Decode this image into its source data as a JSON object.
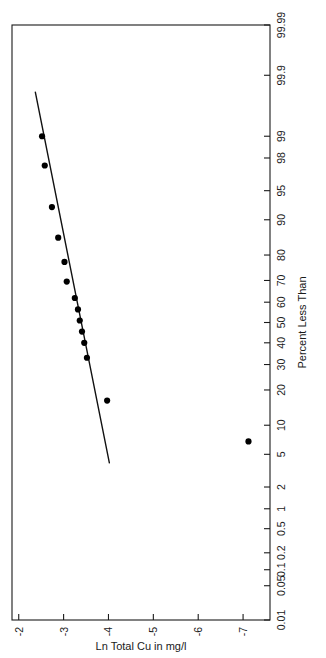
{
  "figure": {
    "kind": "lognormal-probability-plot",
    "rotation_degrees": -90,
    "background_color": "#ffffff",
    "ink_color": "#000000"
  },
  "chart_data": {
    "type": "scatter",
    "title": "",
    "subtitle": "",
    "xlabel": "Percent Less Than",
    "ylabel": "Ln Total Cu in mg/l",
    "xscale": "probability",
    "yscale": "linear",
    "xlim": [
      0.01,
      99.99
    ],
    "ylim": [
      -7.6,
      -1.85
    ],
    "grid": false,
    "legend": null,
    "xticks": [
      "0.01",
      "0.05",
      "0.1",
      "0.2",
      "0.5",
      "1",
      "2",
      "5",
      "10",
      "20",
      "30",
      "40",
      "50",
      "60",
      "70",
      "80",
      "90",
      "95",
      "98",
      "99",
      "99.9",
      "99.99"
    ],
    "xtick_values": [
      0.01,
      0.05,
      0.1,
      0.2,
      0.5,
      1,
      2,
      5,
      10,
      20,
      30,
      40,
      50,
      60,
      70,
      80,
      90,
      95,
      98,
      99,
      99.9,
      99.99
    ],
    "yticks": [
      "-2",
      "-3",
      "-4",
      "-5",
      "-6",
      "-7"
    ],
    "ytick_values": [
      -2,
      -3,
      -4,
      -5,
      -6,
      -7
    ],
    "series": [
      {
        "name": "Total Cu observations",
        "marker": "filled-circle",
        "marker_color": "#000000",
        "x": [
          6.9,
          16.5,
          33.0,
          40.0,
          45.5,
          51.0,
          56.5,
          62.0,
          69.5,
          77.5,
          85.5,
          92.5,
          97.5,
          99.0
        ],
        "y": [
          -7.12,
          -3.97,
          -3.52,
          -3.46,
          -3.41,
          -3.36,
          -3.32,
          -3.25,
          -3.07,
          -3.02,
          -2.88,
          -2.74,
          -2.58,
          -2.52
        ]
      }
    ],
    "fit_line": {
      "name": "fitted lognormal line",
      "color": "#000000",
      "x": [
        4.0,
        99.8
      ],
      "y": [
        -4.02,
        -2.37
      ]
    }
  },
  "axes": {
    "x_axis_title": "Percent Less Than",
    "y_axis_title": "Ln Total Cu in mg/l"
  }
}
